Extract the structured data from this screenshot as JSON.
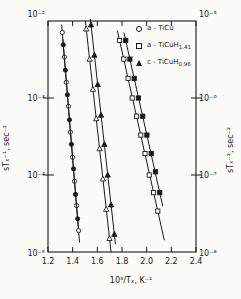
{
  "figure": {
    "background": "#fbfbf8",
    "ink": "#1a1a1a"
  },
  "legend": {
    "items": [
      {
        "marker": "circle-open",
        "label": "a - TiCu",
        "sub": ""
      },
      {
        "marker": "square-open",
        "label": "a - TiCuH",
        "sub": "1.41"
      },
      {
        "marker": "triangle-filled",
        "label": "c - TiCuH",
        "sub": "0.96"
      }
    ]
  },
  "chart_data": {
    "type": "line",
    "title": "",
    "xlabel": "10³/Tₓ, K⁻¹",
    "ylabel_left": "sTₓ⁻¹, sec⁻¹",
    "ylabel_right": "sTₓ⁻², sec⁻²",
    "grid": false,
    "legend_position": "top-right-inside",
    "x_axis": {
      "min": 1.2,
      "max": 2.4,
      "tick_values": [
        1.2,
        1.4,
        1.6,
        1.8,
        2.0,
        2.2,
        2.4
      ],
      "tick_labels": [
        "1.2",
        "1.4",
        "1.6",
        "1.8",
        "2.0",
        "2.2",
        "2.4"
      ]
    },
    "y_left": {
      "scale": "log",
      "logmax": -2,
      "logmin": -5,
      "tick_labels": [
        "10⁻²",
        "10⁻³",
        "10⁻⁴",
        "10⁻⁵"
      ]
    },
    "y_right": {
      "scale": "log",
      "logmax": -5,
      "logmin": -8,
      "tick_labels": [
        "10⁻⁵",
        "10⁻⁶",
        "10⁻⁷",
        "10⁻⁸"
      ]
    },
    "series": [
      {
        "id": "ticu-stx1",
        "name": "a-TiCu sTₓ⁻¹",
        "axis": "left",
        "marker": "circle-open",
        "ext": [
          8,
          12
        ],
        "points": [
          [
            1.316,
            0.0071
          ],
          [
            1.333,
            0.0034
          ],
          [
            1.349,
            0.0016
          ],
          [
            1.366,
            0.00078
          ],
          [
            1.382,
            0.00036
          ],
          [
            1.399,
            0.00017
          ],
          [
            1.415,
            8.3e-05
          ],
          [
            1.432,
            4e-05
          ],
          [
            1.448,
            1.9e-05
          ]
        ]
      },
      {
        "id": "ticu-stx2",
        "name": "a-TiCu sTₓ⁻²",
        "axis": "right",
        "marker": "circle-filled",
        "ext": [
          6,
          8
        ],
        "points": [
          [
            1.324,
            4.9e-06
          ],
          [
            1.341,
            2.3e-06
          ],
          [
            1.357,
            1.1e-06
          ],
          [
            1.374,
            5.2e-07
          ],
          [
            1.39,
            2.5e-07
          ],
          [
            1.407,
            1.2e-07
          ],
          [
            1.423,
            5.6e-08
          ],
          [
            1.44,
            2.7e-08
          ]
        ]
      },
      {
        "id": "ticuh096-stx1",
        "name": "c-TiCuH0.96 sTₓ⁻¹",
        "axis": "left",
        "marker": "triangle-open",
        "ext": [
          8,
          14
        ],
        "points": [
          [
            1.51,
            0.0079
          ],
          [
            1.537,
            0.0032
          ],
          [
            1.564,
            0.0013
          ],
          [
            1.591,
            0.00054
          ],
          [
            1.618,
            0.00022
          ],
          [
            1.645,
            8.9e-05
          ],
          [
            1.672,
            3.6e-05
          ],
          [
            1.699,
            1.5e-05
          ]
        ]
      },
      {
        "id": "ticuh096-stx2",
        "name": "c-TiCuH0.96 sTₓ⁻²",
        "axis": "right",
        "marker": "triangle-filled",
        "ext": [
          6,
          10
        ],
        "points": [
          [
            1.549,
            8.9e-06
          ],
          [
            1.576,
            3.6e-06
          ],
          [
            1.603,
            1.5e-06
          ],
          [
            1.63,
            6e-07
          ],
          [
            1.657,
            2.5e-07
          ],
          [
            1.684,
            1e-07
          ],
          [
            1.711,
            4.1e-08
          ],
          [
            1.738,
            1.7e-08
          ]
        ]
      },
      {
        "id": "ticuh141-stx1",
        "name": "a-TiCuH1.41 sTₓ⁻¹",
        "axis": "left",
        "marker": "square-open",
        "ext": [
          10,
          30
        ],
        "points": [
          [
            1.78,
            0.0056
          ],
          [
            1.814,
            0.0032
          ],
          [
            1.849,
            0.0018
          ],
          [
            1.883,
            0.001
          ],
          [
            1.918,
            0.00058
          ],
          [
            1.952,
            0.00033
          ],
          [
            1.987,
            0.00019
          ],
          [
            2.021,
            0.0001
          ],
          [
            2.056,
            5.9e-05
          ],
          [
            2.09,
            3.4e-05
          ]
        ]
      },
      {
        "id": "ticuh141-stx2",
        "name": "a-TiCuH1.41 sTₓ⁻²",
        "axis": "right",
        "marker": "square-filled",
        "ext": [
          8,
          14
        ],
        "points": [
          [
            1.83,
            5.6e-06
          ],
          [
            1.864,
            3.2e-06
          ],
          [
            1.899,
            1.8e-06
          ],
          [
            1.933,
            1e-06
          ],
          [
            1.968,
            5.8e-07
          ],
          [
            2.002,
            3.3e-07
          ],
          [
            2.037,
            1.9e-07
          ],
          [
            2.071,
            1.1e-07
          ],
          [
            2.106,
            5.9e-08
          ]
        ]
      }
    ]
  }
}
